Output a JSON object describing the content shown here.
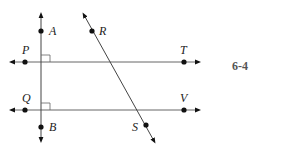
{
  "diagram": {
    "points": {
      "A": "A",
      "R": "R",
      "P": "P",
      "T": "T",
      "Q": "Q",
      "V": "V",
      "B": "B",
      "S": "S"
    },
    "figure_label": "6-4",
    "colors": {
      "line": "#555555",
      "point": "#111111",
      "label": "#222222"
    }
  }
}
